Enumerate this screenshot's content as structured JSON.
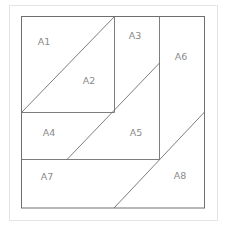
{
  "diagram": {
    "regions": [
      {
        "id": "A1",
        "label": "A1",
        "x": 44,
        "y": 42
      },
      {
        "id": "A2",
        "label": "A2",
        "x": 89,
        "y": 81
      },
      {
        "id": "A3",
        "label": "A3",
        "x": 135,
        "y": 36
      },
      {
        "id": "A4",
        "label": "A4",
        "x": 49,
        "y": 133
      },
      {
        "id": "A5",
        "label": "A5",
        "x": 136,
        "y": 133
      },
      {
        "id": "A6",
        "label": "A6",
        "x": 181,
        "y": 57
      },
      {
        "id": "A7",
        "label": "A7",
        "x": 47,
        "y": 177
      },
      {
        "id": "A8",
        "label": "A8",
        "x": 180,
        "y": 176
      }
    ],
    "colors": {
      "line": "#6e6e6e",
      "label": "#8a8a8a",
      "outer_border": "#c8c8c8"
    }
  }
}
